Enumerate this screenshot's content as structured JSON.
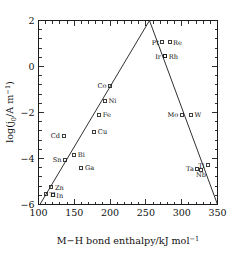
{
  "chart_data": {
    "type": "scatter",
    "title": "",
    "xlabel": "M−H bond enthalpy/kJ mol⁻¹",
    "ylabel": "log(j₀/A m⁻¹)",
    "xlim": [
      100,
      350
    ],
    "ylim": [
      -6,
      2
    ],
    "xticks": [
      100,
      150,
      200,
      250,
      300,
      350
    ],
    "xtick_labels": [
      "100",
      "150",
      "200",
      "250",
      "300",
      "350"
    ],
    "yticks": [
      2,
      0,
      -2,
      -4,
      -6
    ],
    "ytick_labels": [
      "2",
      "0",
      "−2",
      "−4",
      "−6"
    ],
    "x_minor_tick_step": 10,
    "y_minor_tick_step": 0.4,
    "grid": false,
    "legend": "none",
    "marker_style": "open-square",
    "points": [
      {
        "label": "Tl",
        "x": 110,
        "y": -5.55,
        "label_side": "right"
      },
      {
        "label": "In",
        "x": 120,
        "y": -5.6,
        "label_side": "right"
      },
      {
        "label": "Zn",
        "x": 118,
        "y": -5.25,
        "label_side": "right"
      },
      {
        "label": "Sn",
        "x": 137,
        "y": -4.05,
        "label_side": "left"
      },
      {
        "label": "Cd",
        "x": 135,
        "y": -3.0,
        "label_side": "left"
      },
      {
        "label": "Bi",
        "x": 150,
        "y": -3.85,
        "label_side": "right"
      },
      {
        "label": "Ga",
        "x": 160,
        "y": -4.4,
        "label_side": "right"
      },
      {
        "label": "Cu",
        "x": 178,
        "y": -2.85,
        "label_side": "right"
      },
      {
        "label": "Fe",
        "x": 185,
        "y": -2.1,
        "label_side": "right"
      },
      {
        "label": "Ni",
        "x": 193,
        "y": -1.5,
        "label_side": "right"
      },
      {
        "label": "Co",
        "x": 200,
        "y": -0.85,
        "label_side": "left"
      },
      {
        "label": "Pt",
        "x": 273,
        "y": 1.05,
        "label_side": "left"
      },
      {
        "label": "Re",
        "x": 283,
        "y": 1.05,
        "label_side": "right"
      },
      {
        "label": "Ir",
        "x": 276,
        "y": 0.45,
        "label_side": "left"
      },
      {
        "label": "Rh",
        "x": 277,
        "y": 0.45,
        "label_side": "right"
      },
      {
        "label": "Mo",
        "x": 300,
        "y": -2.1,
        "label_side": "left"
      },
      {
        "label": "W",
        "x": 313,
        "y": -2.1,
        "label_side": "right"
      },
      {
        "label": "Ta",
        "x": 322,
        "y": -4.45,
        "label_side": "left"
      },
      {
        "label": "Nb",
        "x": 327,
        "y": -4.5,
        "label_side": "below"
      },
      {
        "label": "Ti",
        "x": 337,
        "y": -4.3,
        "label_side": "left"
      }
    ],
    "volcano_lines": [
      {
        "name": "ascending-branch",
        "from": {
          "x": 102,
          "y": -6.0
        },
        "to": {
          "x": 255,
          "y": 2.0
        }
      },
      {
        "name": "descending-branch",
        "from": {
          "x": 255,
          "y": 2.0
        },
        "to": {
          "x": 350,
          "y": -6.0
        }
      }
    ],
    "apex": {
      "x": 255,
      "y": 2.0
    }
  },
  "axes": {
    "y_label_main": "log(j",
    "y_label_sub": "0",
    "y_label_mid": "/A m",
    "y_label_sup": "−1",
    "y_label_close": ")",
    "x_label_main": "M−H bond enthalpy/kJ mol",
    "x_label_sup": "−1"
  }
}
